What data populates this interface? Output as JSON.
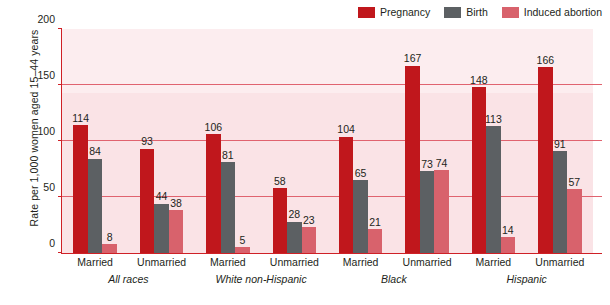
{
  "chart_data": {
    "type": "bar",
    "title": "",
    "xlabel": "",
    "ylabel": "Rate per 1,000 women aged 15–44 years",
    "ylim": [
      0,
      200
    ],
    "yticks": [
      0,
      50,
      100,
      150,
      200
    ],
    "ytick_labels": [
      "0",
      "50",
      "100",
      "150",
      "200"
    ],
    "grid": "horizontal gridlines at 50, 100, 150",
    "legend_position": "top-right",
    "legend": [
      "Pregnancy",
      "Birth",
      "Induced abortion"
    ],
    "series": [
      {
        "name": "Pregnancy",
        "color": "#c0171c",
        "values": [
          114,
          93,
          106,
          58,
          104,
          167,
          148,
          166
        ]
      },
      {
        "name": "Birth",
        "color": "#5c6063",
        "values": [
          84,
          44,
          81,
          28,
          65,
          73,
          113,
          91
        ]
      },
      {
        "name": "Induced abortion",
        "color": "#d8626c",
        "values": [
          8,
          38,
          5,
          23,
          21,
          74,
          14,
          57
        ]
      }
    ],
    "categories": [
      "Married",
      "Unmarried",
      "Married",
      "Unmarried",
      "Married",
      "Unmarried",
      "Married",
      "Unmarried"
    ],
    "groups": [
      {
        "label": "All races",
        "categories": [
          "Married",
          "Unmarried"
        ]
      },
      {
        "label": "White non-Hispanic",
        "categories": [
          "Married",
          "Unmarried"
        ]
      },
      {
        "label": "Black",
        "categories": [
          "Married",
          "Unmarried"
        ]
      },
      {
        "label": "Hispanic",
        "categories": [
          "Married",
          "Unmarried"
        ]
      }
    ],
    "data_labels": [
      [
        "114",
        "84",
        "8"
      ],
      [
        "93",
        "44",
        "38"
      ],
      [
        "106",
        "81",
        "5"
      ],
      [
        "58",
        "28",
        "23"
      ],
      [
        "104",
        "65",
        "21"
      ],
      [
        "167",
        "73",
        "74"
      ],
      [
        "148",
        "113",
        "14"
      ],
      [
        "166",
        "91",
        "57"
      ]
    ]
  },
  "colors": {
    "pregnancy": "#c0171c",
    "birth": "#5c6063",
    "induced_abortion": "#d8626c",
    "plot_background": "#fae3e6",
    "plot_background_upper": "#fcedef",
    "gridline": "#e0636f",
    "axis": "#cf2026",
    "text": "#231f20"
  },
  "legend": {
    "items": [
      {
        "label": "Pregnancy",
        "color": "#c0171c"
      },
      {
        "label": "Birth",
        "color": "#5c6063"
      },
      {
        "label": "Induced abortion",
        "color": "#d8626c"
      }
    ]
  },
  "axes": {
    "y_title": "Rate per 1,000 women aged 15–44 years",
    "y_ticks": [
      "200",
      "150",
      "100",
      "50",
      "0"
    ]
  }
}
